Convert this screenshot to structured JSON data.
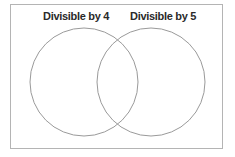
{
  "diagram": {
    "type": "venn",
    "sets": [
      {
        "label": "Divisible by 4",
        "cx": 84,
        "cy": 82,
        "r": 54
      },
      {
        "label": "Divisible by 5",
        "cx": 151,
        "cy": 82,
        "r": 54
      }
    ],
    "colors": {
      "circle_stroke": "#9a9a9a",
      "frame_border": "#b4b4b4",
      "label_text": "#2a2a2a"
    }
  }
}
